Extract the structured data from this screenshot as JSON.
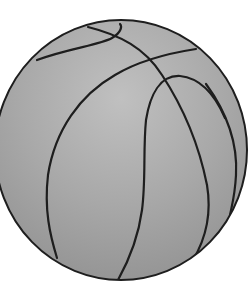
{
  "image": {
    "subject": "basketball",
    "style": "grayscale line drawing",
    "colors": {
      "background": "#ffffff",
      "ball_fill": "#a9a9a9",
      "ball_highlight": "#c4c4c4",
      "ball_shadow": "#8f8f8f",
      "seam_stroke": "#1e1e1e"
    }
  }
}
